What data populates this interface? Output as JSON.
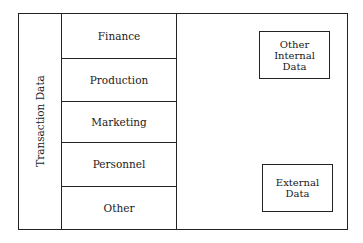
{
  "diagram": {
    "transaction_label": "Transaction Data",
    "departments": [
      {
        "label": "Finance"
      },
      {
        "label": "Production"
      },
      {
        "label": "Marketing"
      },
      {
        "label": "Personnel"
      },
      {
        "label": "Other"
      }
    ],
    "other_internal": "Other\nInternal\nData",
    "external": "External\nData"
  }
}
